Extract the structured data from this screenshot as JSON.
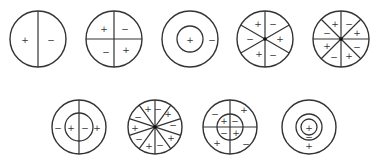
{
  "diagram": {
    "stroke_color": "#333333",
    "background": "#ffffff",
    "rows": [
      {
        "name": "row-1",
        "circles": [
          {
            "id": "c1",
            "cx": 38,
            "cy": 39,
            "r": 28,
            "type": "sectors",
            "divisions": 2,
            "rotation": 90,
            "signs": [
              {
                "x": 25,
                "y": 40,
                "s": "+"
              },
              {
                "x": 51,
                "y": 40,
                "s": "−"
              }
            ]
          },
          {
            "id": "c2",
            "cx": 114,
            "cy": 39,
            "r": 28,
            "type": "sectors",
            "divisions": 4,
            "rotation": 0,
            "signs": [
              {
                "x": 104,
                "y": 29,
                "s": "+"
              },
              {
                "x": 125,
                "y": 29,
                "s": "−"
              },
              {
                "x": 106,
                "y": 52,
                "s": "−"
              },
              {
                "x": 126,
                "y": 50,
                "s": "+"
              }
            ]
          },
          {
            "id": "c3",
            "cx": 190,
            "cy": 39,
            "r": 28,
            "type": "concentric",
            "rings": [
              13
            ],
            "signs": [
              {
                "x": 190,
                "y": 40,
                "s": "+"
              },
              {
                "x": 212,
                "y": 40,
                "s": "−"
              }
            ]
          },
          {
            "id": "c4",
            "cx": 265,
            "cy": 39,
            "r": 28,
            "type": "sectors",
            "divisions": 6,
            "rotation": 90,
            "signs": [
              {
                "x": 258,
                "y": 24,
                "s": "+"
              },
              {
                "x": 273,
                "y": 24,
                "s": "−"
              },
              {
                "x": 280,
                "y": 39,
                "s": "+"
              },
              {
                "x": 273,
                "y": 55,
                "s": "−"
              },
              {
                "x": 259,
                "y": 54,
                "s": "+"
              },
              {
                "x": 250,
                "y": 39,
                "s": "−"
              }
            ]
          },
          {
            "id": "c5",
            "cx": 341,
            "cy": 39,
            "r": 28,
            "type": "sectors",
            "divisions": 8,
            "rotation": 0,
            "signs": [
              {
                "x": 335,
                "y": 24,
                "s": "+"
              },
              {
                "x": 349,
                "y": 24,
                "s": "−"
              },
              {
                "x": 357,
                "y": 33,
                "s": "+"
              },
              {
                "x": 357,
                "y": 47,
                "s": "−"
              },
              {
                "x": 349,
                "y": 56,
                "s": "+"
              },
              {
                "x": 334,
                "y": 57,
                "s": "−"
              },
              {
                "x": 327,
                "y": 46,
                "s": "+"
              },
              {
                "x": 327,
                "y": 33,
                "s": "−"
              }
            ]
          }
        ]
      },
      {
        "name": "row-2",
        "circles": [
          {
            "id": "c6",
            "cx": 79,
            "cy": 127,
            "r": 27,
            "type": "concentric-split",
            "rings": [
              14
            ],
            "divisions": 2,
            "rotation": 90,
            "signs": [
              {
                "x": 58,
                "y": 128,
                "s": "−"
              },
              {
                "x": 71,
                "y": 128,
                "s": "+"
              },
              {
                "x": 85,
                "y": 128,
                "s": "−"
              },
              {
                "x": 97,
                "y": 128,
                "s": "+"
              }
            ]
          },
          {
            "id": "c7",
            "cx": 155,
            "cy": 127,
            "r": 27,
            "type": "sectors",
            "divisions": 10,
            "rotation": 90,
            "signs": [
              {
                "x": 148,
                "y": 109,
                "s": "+"
              },
              {
                "x": 158,
                "y": 109,
                "s": "−"
              },
              {
                "x": 168,
                "y": 114,
                "s": "+"
              },
              {
                "x": 173,
                "y": 125,
                "s": "−"
              },
              {
                "x": 171,
                "y": 138,
                "s": "+"
              },
              {
                "x": 160,
                "y": 145,
                "s": "−"
              },
              {
                "x": 149,
                "y": 146,
                "s": "+"
              },
              {
                "x": 139,
                "y": 139,
                "s": "−"
              },
              {
                "x": 135,
                "y": 128,
                "s": "+"
              },
              {
                "x": 138,
                "y": 117,
                "s": "−"
              }
            ]
          },
          {
            "id": "c8",
            "cx": 230,
            "cy": 127,
            "r": 27,
            "type": "concentric-split",
            "rings": [
              13
            ],
            "divisions": 4,
            "rotation": 0,
            "signs": [
              {
                "x": 224,
                "y": 121,
                "s": "+"
              },
              {
                "x": 235,
                "y": 121,
                "s": "−"
              },
              {
                "x": 224,
                "y": 133,
                "s": "−"
              },
              {
                "x": 236,
                "y": 133,
                "s": "+"
              },
              {
                "x": 215,
                "y": 114,
                "s": "−"
              },
              {
                "x": 244,
                "y": 110,
                "s": "+"
              },
              {
                "x": 217,
                "y": 143,
                "s": "+"
              },
              {
                "x": 246,
                "y": 144,
                "s": "−"
              }
            ]
          },
          {
            "id": "c9",
            "cx": 309,
            "cy": 127,
            "r": 27,
            "type": "concentric",
            "rings": [
              13,
              8
            ],
            "signs": [
              {
                "x": 309,
                "y": 128,
                "s": "+"
              },
              {
                "x": 309,
                "y": 137,
                "s": "−"
              },
              {
                "x": 309,
                "y": 146,
                "s": "+"
              }
            ]
          }
        ]
      }
    ]
  }
}
